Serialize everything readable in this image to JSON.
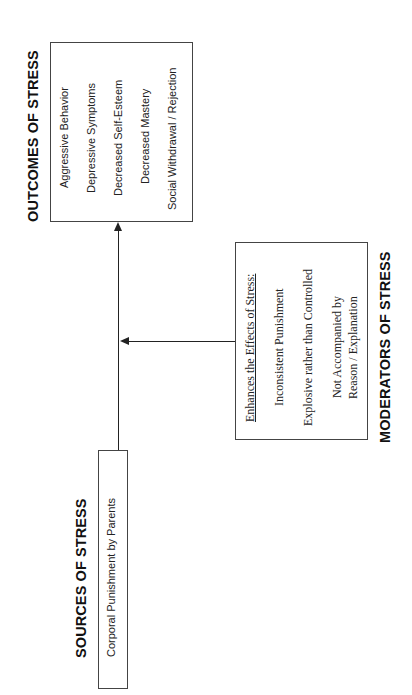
{
  "diagram": {
    "orientation": "rotated-90-ccw",
    "sources": {
      "title": "SOURCES OF STRESS",
      "items": [
        "Corporal Punishment by Parents"
      ]
    },
    "outcomes": {
      "title": "OUTCOMES OF STRESS",
      "items": [
        "Aggressive Behavior",
        "Depressive Symptoms",
        "Decreased Self-Esteem",
        "Decreased Mastery",
        "Social Withdrawal / Rejection"
      ]
    },
    "moderators": {
      "title": "MODERATORS OF STRESS",
      "heading": "Enhances the Effects of Stress:",
      "items": [
        "Inconsistent Punishment",
        "Explosive rather than Controlled",
        "Not Accompanied by",
        "Reason / Explanation"
      ]
    },
    "colors": {
      "line": "#222222",
      "box_border": "#444444",
      "background": "#ffffff"
    }
  }
}
